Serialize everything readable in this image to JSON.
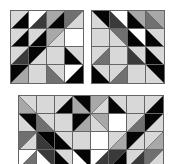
{
  "palette": {
    "W": "#ffffff",
    "L": "#d8d8d8",
    "G": "#a8a8a8",
    "M": "#707070",
    "D": "#3a3a3a",
    "K": "#050505"
  },
  "grids": [
    {
      "name": "puzzle-grid-top-left",
      "left": 10,
      "top": 10,
      "cols": 4,
      "rows": 4,
      "cells": [
        [
          {
            "d": "/",
            "a": "L",
            "b": "K"
          },
          {
            "d": "/",
            "a": "W",
            "b": "D"
          },
          {
            "d": "/",
            "a": "G",
            "b": "K"
          },
          {
            "d": "/",
            "a": "M",
            "b": "L"
          }
        ],
        [
          {
            "d": "/",
            "a": "L",
            "b": "K"
          },
          {
            "d": "/",
            "a": "L",
            "b": "K"
          },
          {
            "d": "/",
            "a": "G",
            "b": "L"
          },
          {
            "d": "-",
            "a": "W",
            "b": "W"
          }
        ],
        [
          {
            "d": "/",
            "a": "L",
            "b": "D"
          },
          {
            "d": "/",
            "a": "K",
            "b": "L"
          },
          {
            "d": "-",
            "a": "L",
            "b": "L"
          },
          {
            "d": "\\",
            "a": "L",
            "b": "K"
          }
        ],
        [
          {
            "d": "/",
            "a": "K",
            "b": "G"
          },
          {
            "d": "-",
            "a": "L",
            "b": "L"
          },
          {
            "d": "\\",
            "a": "L",
            "b": "M"
          },
          {
            "d": "/",
            "a": "W",
            "b": "K"
          }
        ]
      ]
    },
    {
      "name": "puzzle-grid-top-right",
      "left": 91,
      "top": 10,
      "cols": 4,
      "rows": 4,
      "cells": [
        [
          {
            "d": "\\",
            "a": "K",
            "b": "L"
          },
          {
            "d": "\\",
            "a": "W",
            "b": "D"
          },
          {
            "d": "\\",
            "a": "G",
            "b": "K"
          },
          {
            "d": "\\",
            "a": "G",
            "b": "M"
          }
        ],
        [
          {
            "d": "-",
            "a": "L",
            "b": "L"
          },
          {
            "d": "\\",
            "a": "M",
            "b": "L"
          },
          {
            "d": "\\",
            "a": "W",
            "b": "K"
          },
          {
            "d": "\\",
            "a": "L",
            "b": "K"
          }
        ],
        [
          {
            "d": "/",
            "a": "L",
            "b": "M"
          },
          {
            "d": "-",
            "a": "L",
            "b": "L"
          },
          {
            "d": "\\",
            "a": "L",
            "b": "D"
          },
          {
            "d": "\\",
            "a": "L",
            "b": "K"
          }
        ],
        [
          {
            "d": "\\",
            "a": "L",
            "b": "K"
          },
          {
            "d": "/",
            "a": "L",
            "b": "M"
          },
          {
            "d": "-",
            "a": "L",
            "b": "L"
          },
          {
            "d": "\\",
            "a": "K",
            "b": "L"
          }
        ]
      ]
    },
    {
      "name": "puzzle-grid-bottom",
      "left": 18,
      "top": 95,
      "cols": 8,
      "rows": 4,
      "cells": [
        [
          {
            "d": "\\",
            "a": "L",
            "b": "G"
          },
          {
            "d": "-",
            "a": "L",
            "b": "L"
          },
          {
            "d": "/",
            "a": "L",
            "b": "K"
          },
          {
            "d": "\\",
            "a": "K",
            "b": "G"
          },
          {
            "d": "/",
            "a": "G",
            "b": "L"
          },
          {
            "d": "\\",
            "a": "L",
            "b": "K"
          },
          {
            "d": "-",
            "a": "L",
            "b": "L"
          },
          {
            "d": "/",
            "a": "L",
            "b": "K"
          }
        ],
        [
          {
            "d": "\\",
            "a": "K",
            "b": "L"
          },
          {
            "d": "\\",
            "a": "L",
            "b": "M"
          },
          {
            "d": "-",
            "a": "L",
            "b": "L"
          },
          {
            "d": "/",
            "a": "K",
            "b": "G"
          },
          {
            "d": "\\",
            "a": "G",
            "b": "L"
          },
          {
            "d": "-",
            "a": "W",
            "b": "L"
          },
          {
            "d": "/",
            "a": "L",
            "b": "M"
          },
          {
            "d": "/",
            "a": "K",
            "b": "L"
          }
        ],
        [
          {
            "d": "/",
            "a": "M",
            "b": "L"
          },
          {
            "d": "\\",
            "a": "K",
            "b": "D"
          },
          {
            "d": "\\",
            "a": "L",
            "b": "K"
          },
          {
            "d": "-",
            "a": "L",
            "b": "L"
          },
          {
            "d": "-",
            "a": "W",
            "b": "W"
          },
          {
            "d": "/",
            "a": "L",
            "b": "G"
          },
          {
            "d": "/",
            "a": "K",
            "b": "L"
          },
          {
            "d": "/",
            "a": "L",
            "b": "G"
          }
        ],
        [
          {
            "d": "/",
            "a": "W",
            "b": "M"
          },
          {
            "d": "\\",
            "a": "D",
            "b": "W"
          },
          {
            "d": "\\",
            "a": "L",
            "b": "K"
          },
          {
            "d": "\\",
            "a": "K",
            "b": "W"
          },
          {
            "d": "/",
            "a": "W",
            "b": "D"
          },
          {
            "d": "/",
            "a": "D",
            "b": "K"
          },
          {
            "d": "/",
            "a": "L",
            "b": "D"
          },
          {
            "d": "/",
            "a": "M",
            "b": "L"
          }
        ]
      ]
    }
  ]
}
